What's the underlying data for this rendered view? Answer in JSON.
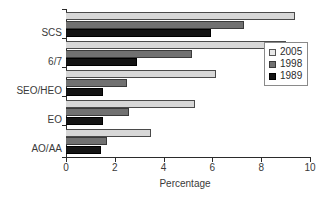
{
  "chart_data": {
    "type": "bar",
    "orientation": "horizontal",
    "title": "",
    "xlabel": "Percentage",
    "ylabel": "",
    "categories": [
      "AO/AA",
      "EO",
      "SEO/HEO",
      "6/7",
      "SCS"
    ],
    "categories_top_to_bottom": [
      "SCS",
      "6/7",
      "SEO/HEO",
      "EO",
      "AO/AA"
    ],
    "series": [
      {
        "name": "2005",
        "color": "#d7d7d7",
        "values": [
          9.4,
          9.0,
          6.15,
          5.3,
          3.5
        ]
      },
      {
        "name": "1998",
        "color": "#717171",
        "values": [
          7.3,
          5.15,
          2.5,
          2.6,
          1.7
        ]
      },
      {
        "name": "1989",
        "color": "#141414",
        "values": [
          5.95,
          2.9,
          1.5,
          1.5,
          1.45
        ]
      }
    ],
    "xlim": [
      0,
      10
    ],
    "xticks": [
      0,
      2,
      4,
      6,
      8,
      10
    ],
    "xtick_labels": [
      "0",
      "2",
      "4",
      "6",
      "8",
      "10"
    ],
    "grid": false,
    "legend": {
      "position": "right-upper",
      "entries": [
        "2005",
        "1998",
        "1989"
      ]
    }
  }
}
